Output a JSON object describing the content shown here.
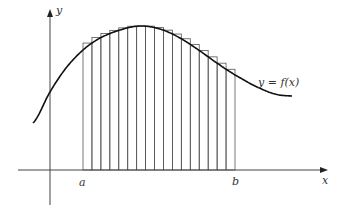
{
  "diagram": {
    "labels": {
      "y_axis": "y",
      "x_axis": "x",
      "a": "a",
      "b": "b",
      "curve": "y = f(x)"
    },
    "interval": {
      "a_px": 83,
      "b_px": 235,
      "num_rectangles": 17
    },
    "colors": {
      "line": "#222222",
      "rect": "#555555",
      "axis": "#444444"
    }
  }
}
